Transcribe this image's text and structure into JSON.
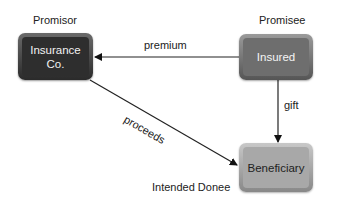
{
  "nodes": {
    "promisor": {
      "role": "Promisor",
      "label_line1": "Insurance",
      "label_line2": "Co."
    },
    "promisee": {
      "role": "Promisee",
      "label": "Insured"
    },
    "donee": {
      "role": "Intended Donee",
      "label": "Beneficiary"
    }
  },
  "edges": {
    "premium": "premium",
    "gift": "gift",
    "proceeds": "proceeds"
  }
}
